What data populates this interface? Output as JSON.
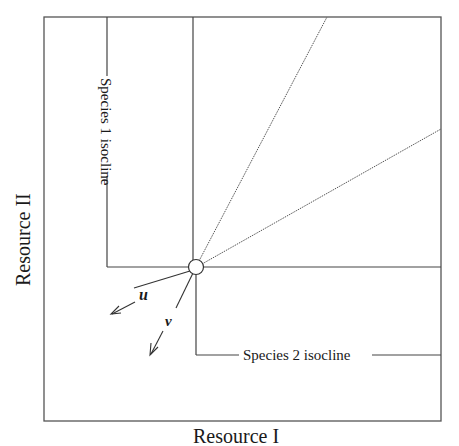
{
  "diagram": {
    "type": "resource competition isocline diagram",
    "axes": {
      "x_label": "Resource I",
      "y_label": "Resource II"
    },
    "isoclines": [
      {
        "label": "Species 1 isocline",
        "shape": "L-shaped (vertical then horizontal)"
      },
      {
        "label": "Species 2 isocline",
        "shape": "L-shaped (vertical then horizontal)"
      }
    ],
    "equilibrium_point": {
      "marker": "open circle"
    },
    "consumption_vectors": [
      {
        "label": "u"
      },
      {
        "label": "v"
      }
    ],
    "rays": [
      "steep dotted ray from equilibrium to top edge",
      "shallow dotted ray from equilibrium to right edge"
    ],
    "colors": {
      "line": "#4a4a4a",
      "text": "#1a1a1a",
      "background": "#ffffff"
    }
  }
}
